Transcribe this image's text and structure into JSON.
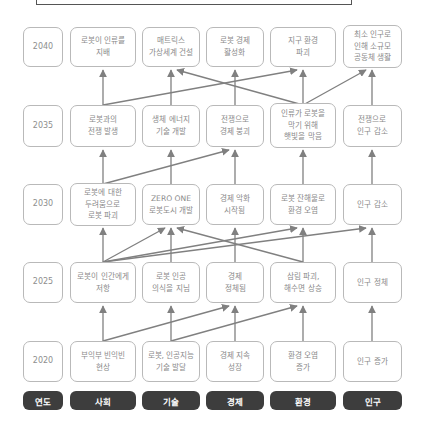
{
  "colors": {
    "node_border": "#b9b9b9",
    "node_text": "#8a8a8a",
    "header_bg": "#3d3d3d",
    "header_text": "#ffffff",
    "arrow": "#808080"
  },
  "headers": [
    {
      "key": "year",
      "label": "연도"
    },
    {
      "key": "society",
      "label": "사회"
    },
    {
      "key": "technology",
      "label": "기술"
    },
    {
      "key": "economy",
      "label": "경제"
    },
    {
      "key": "environment",
      "label": "환경"
    },
    {
      "key": "population",
      "label": "인구"
    }
  ],
  "rows": [
    {
      "year": "2040",
      "cells": [
        "로봇이 인류를\n지배",
        "매트릭스\n가상세계 건설",
        "로봇 경제\n활성화",
        "지구 환경\n파괴",
        "최소 인구로\n인해 소규모\n공동체 생활"
      ]
    },
    {
      "year": "2035",
      "cells": [
        "로봇과의\n전쟁 발생",
        "생체 에너지\n기술 개발",
        "전쟁으로\n경제 붕괴",
        "인류가 로봇을\n막기 위해\n햇빛을 막음",
        "전쟁으로\n인구 감소"
      ]
    },
    {
      "year": "2030",
      "cells": [
        "로봇에 대한\n두려움으로\n로봇 파괴",
        "ZERO ONE\n로봇도시 개발",
        "경제 악화\n시작됨",
        "로봇 잔해물로\n환경 오염",
        "인구 감소"
      ]
    },
    {
      "year": "2025",
      "cells": [
        "로봇이 인간에게\n저항",
        "로봇 인공\n의식을 지님",
        "경제\n정체됨",
        "삼림 파괴,\n해수면 상승",
        "인구 정체"
      ]
    },
    {
      "year": "2020",
      "cells": [
        "부익부 빈익빈\n현상",
        "로봇, 인공지능\n기술 발달",
        "경제 지속\n성장",
        "환경 오염\n증가",
        "인구 증가"
      ]
    }
  ],
  "edges": [
    {
      "from": [
        "2035",
        0
      ],
      "to": [
        "2040",
        0
      ]
    },
    {
      "from": [
        "2035",
        0
      ],
      "to": [
        "2040",
        3
      ]
    },
    {
      "from": [
        "2035",
        1
      ],
      "to": [
        "2040",
        1
      ]
    },
    {
      "from": [
        "2035",
        2
      ],
      "to": [
        "2040",
        2
      ]
    },
    {
      "from": [
        "2035",
        3
      ],
      "to": [
        "2040",
        3
      ]
    },
    {
      "from": [
        "2035",
        3
      ],
      "to": [
        "2040",
        1
      ]
    },
    {
      "from": [
        "2035",
        3
      ],
      "to": [
        "2040",
        4
      ]
    },
    {
      "from": [
        "2035",
        4
      ],
      "to": [
        "2040",
        4
      ]
    },
    {
      "from": [
        "2030",
        0
      ],
      "to": [
        "2035",
        0
      ]
    },
    {
      "from": [
        "2030",
        0
      ],
      "to": [
        "2035",
        2
      ]
    },
    {
      "from": [
        "2030",
        1
      ],
      "to": [
        "2035",
        1
      ]
    },
    {
      "from": [
        "2030",
        2
      ],
      "to": [
        "2035",
        2
      ]
    },
    {
      "from": [
        "2030",
        3
      ],
      "to": [
        "2035",
        3
      ]
    },
    {
      "from": [
        "2030",
        4
      ],
      "to": [
        "2035",
        4
      ]
    },
    {
      "from": [
        "2025",
        0
      ],
      "to": [
        "2030",
        0
      ]
    },
    {
      "from": [
        "2025",
        0
      ],
      "to": [
        "2030",
        1
      ]
    },
    {
      "from": [
        "2025",
        0
      ],
      "to": [
        "2030",
        3
      ]
    },
    {
      "from": [
        "2025",
        0
      ],
      "to": [
        "2030",
        4
      ]
    },
    {
      "from": [
        "2025",
        1
      ],
      "to": [
        "2030",
        1
      ]
    },
    {
      "from": [
        "2025",
        2
      ],
      "to": [
        "2030",
        2
      ]
    },
    {
      "from": [
        "2025",
        3
      ],
      "to": [
        "2030",
        3
      ]
    },
    {
      "from": [
        "2025",
        3
      ],
      "to": [
        "2030",
        1
      ]
    },
    {
      "from": [
        "2025",
        4
      ],
      "to": [
        "2030",
        4
      ]
    },
    {
      "from": [
        "2020",
        0
      ],
      "to": [
        "2025",
        0
      ]
    },
    {
      "from": [
        "2020",
        0
      ],
      "to": [
        "2025",
        2
      ]
    },
    {
      "from": [
        "2020",
        1
      ],
      "to": [
        "2025",
        1
      ]
    },
    {
      "from": [
        "2020",
        1
      ],
      "to": [
        "2025",
        3
      ]
    },
    {
      "from": [
        "2020",
        2
      ],
      "to": [
        "2025",
        2
      ]
    },
    {
      "from": [
        "2020",
        3
      ],
      "to": [
        "2025",
        3
      ]
    },
    {
      "from": [
        "2020",
        4
      ],
      "to": [
        "2025",
        4
      ]
    }
  ]
}
